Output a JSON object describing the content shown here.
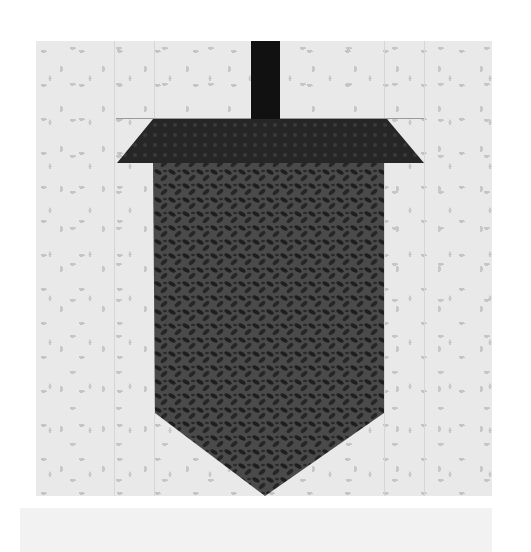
{
  "image": {
    "subject": "acorn quilt block",
    "colors": {
      "background_fabric": "#e9e9e9",
      "leaf_print": "#c4c4c4",
      "acorn_cap": "#2a2a2a",
      "acorn_body": "#3c3c3c",
      "stem": "#111111",
      "bottom_band": "#f2f2f2"
    }
  }
}
